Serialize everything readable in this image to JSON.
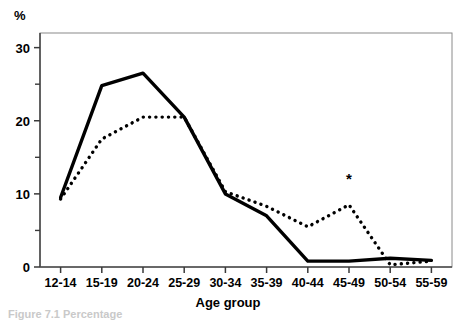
{
  "figure": {
    "y_axis_unit_label": "%",
    "x_axis_title": "Age group",
    "caption_partial": "Figure 7.1  Percentage",
    "annotation_symbol": "*"
  },
  "chart_data": {
    "type": "line",
    "title": "",
    "subtitle": "",
    "xlabel": "Age group",
    "ylabel": "%",
    "ylim": [
      0,
      32
    ],
    "yticks": [
      0,
      10,
      20,
      30
    ],
    "yticks_minor": [
      5,
      15,
      25
    ],
    "grid": false,
    "legend": null,
    "legend_position": "none",
    "categories": [
      "12-14",
      "15-19",
      "20-24",
      "25-29",
      "30-34",
      "35-39",
      "40-44",
      "45-49",
      "50-54",
      "55-59"
    ],
    "series": [
      {
        "name": "solid-line",
        "style": "solid",
        "values": [
          9.5,
          24.8,
          26.5,
          20.5,
          10.0,
          7.0,
          0.8,
          0.8,
          1.2,
          0.9
        ]
      },
      {
        "name": "dotted-line",
        "style": "dotted",
        "values": [
          9.3,
          17.5,
          20.5,
          20.5,
          10.3,
          8.3,
          5.5,
          8.5,
          0.3,
          0.8
        ]
      }
    ],
    "annotations": [
      {
        "symbol": "*",
        "category": "45-49",
        "value": 11.3,
        "series": "dotted-line"
      }
    ]
  }
}
